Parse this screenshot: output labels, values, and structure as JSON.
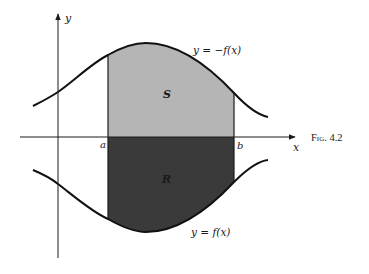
{
  "figure": {
    "caption": "Fig. 4.2",
    "colors": {
      "region_S": "#b5b5b5",
      "region_R": "#3a3a3a",
      "axes": "#1a1a1a",
      "curves": "#111111",
      "background": "#ffffff"
    },
    "axes": {
      "x_label": "x",
      "y_label": "y"
    },
    "ticks": {
      "a_label": "a",
      "b_label": "b"
    },
    "regions": {
      "S_label": "S",
      "R_label": "R"
    },
    "curves": {
      "upper_label": "y = −f(x)",
      "lower_label": "y = f(x)"
    }
  }
}
